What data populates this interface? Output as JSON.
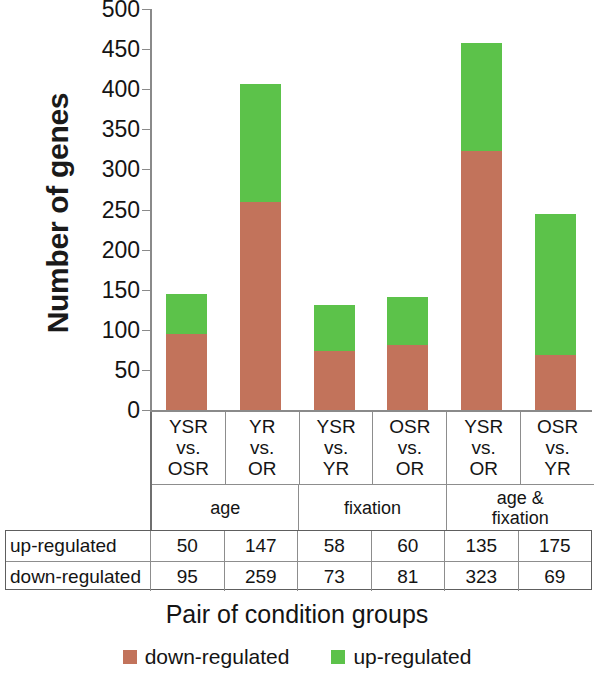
{
  "chart_data": {
    "type": "bar",
    "subtype": "stacked-bar",
    "title": "",
    "xlabel": "Pair of condition groups",
    "ylabel": "Number of genes",
    "categories": [
      {
        "lines": [
          "YSR",
          "vs.",
          "OSR"
        ],
        "group": "age"
      },
      {
        "lines": [
          "YR",
          "vs.",
          "OR"
        ],
        "group": "age"
      },
      {
        "lines": [
          "YSR",
          "vs.",
          "YR"
        ],
        "group": "fixation"
      },
      {
        "lines": [
          "OSR",
          "vs.",
          "OR"
        ],
        "group": "fixation"
      },
      {
        "lines": [
          "YSR",
          "vs.",
          "OR"
        ],
        "group": "age & fixation"
      },
      {
        "lines": [
          "OSR",
          "vs.",
          "YR"
        ],
        "group": "age & fixation"
      }
    ],
    "groups": [
      {
        "label_lines": [
          "age"
        ],
        "span": 2
      },
      {
        "label_lines": [
          "fixation"
        ],
        "span": 2
      },
      {
        "label_lines": [
          "age &",
          "fixation"
        ],
        "span": 2
      }
    ],
    "series": [
      {
        "name": "down-regulated",
        "color": "#C2735B",
        "values": [
          95,
          259,
          73,
          81,
          323,
          69
        ]
      },
      {
        "name": "up-regulated",
        "color": "#5CC24A",
        "values": [
          50,
          147,
          58,
          60,
          135,
          175
        ]
      }
    ],
    "ylim": [
      0,
      500
    ],
    "ytick_step": 50,
    "yticks": [
      "0",
      "50",
      "100",
      "150",
      "200",
      "250",
      "300",
      "350",
      "400",
      "450",
      "500"
    ],
    "grid": false,
    "legend_position": "bottom"
  },
  "table": {
    "rows": [
      {
        "header": "up-regulated",
        "values": [
          "50",
          "147",
          "58",
          "60",
          "135",
          "175"
        ]
      },
      {
        "header": "down-regulated",
        "values": [
          "95",
          "259",
          "73",
          "81",
          "323",
          "69"
        ]
      }
    ]
  },
  "legend": {
    "items": [
      {
        "label": "down-regulated",
        "color": "#C2735B"
      },
      {
        "label": "up-regulated",
        "color": "#5CC24A"
      }
    ]
  }
}
